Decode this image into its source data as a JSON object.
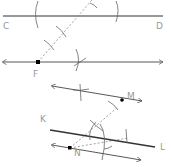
{
  "diagram": {
    "type": "geometric-construction",
    "labels": {
      "C": "C",
      "D": "D",
      "F": "F",
      "M": "M",
      "K": "K",
      "N": "N",
      "L": "L"
    },
    "colors": {
      "line": "#333333",
      "arc": "#666666",
      "dashed": "#888888",
      "label": "#9a9a9a",
      "point": "#000000"
    },
    "constructions": [
      {
        "name": "parallel-through-F",
        "base_line": "CD",
        "point": "F"
      },
      {
        "name": "parallel-through-N",
        "base_line": "KL",
        "point": "N",
        "reference_point": "M"
      }
    ]
  }
}
